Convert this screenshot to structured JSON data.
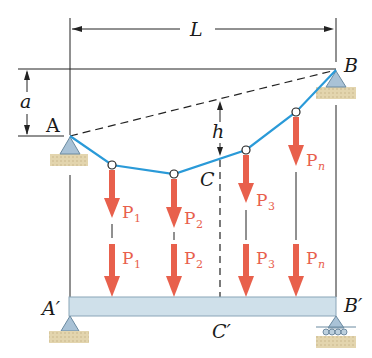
{
  "labels": {
    "span": "L",
    "sag_offset": "a",
    "depth": "h",
    "left_support": "A",
    "right_support": "B",
    "lowest_point": "C",
    "beam_left": "A′",
    "beam_right": "B′",
    "beam_mid": "C′"
  },
  "loads": [
    {
      "name": "P",
      "sub": "1"
    },
    {
      "name": "P",
      "sub": "2"
    },
    {
      "name": "P",
      "sub": "3"
    },
    {
      "name": "P",
      "sub": "n"
    }
  ],
  "colors": {
    "cable": "#2a9ad8",
    "load": "#e8604c",
    "beam": "#cfe0ea",
    "ground": "#d8c9a0",
    "line": "#222222"
  }
}
